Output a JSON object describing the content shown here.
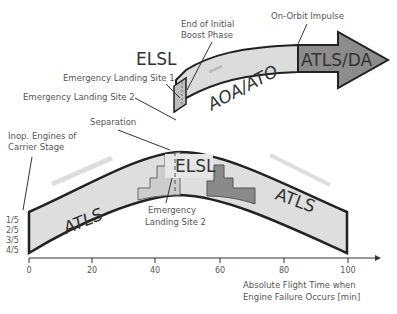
{
  "upper_arrow": {
    "segments": [
      {
        "label": "AOA/ATO",
        "color": "#d9d9d9"
      },
      {
        "label": "ATLS/DA",
        "color": "#8c8c8c"
      }
    ],
    "annotations": {
      "elsl": "ELSL",
      "site1": "Emergency Landing Site 1",
      "site2": "Emergency Landing Site 2",
      "end_boost_1": "End of Initial",
      "end_boost_2": "Boost Phase",
      "on_orbit": "On-Orbit Impulse"
    }
  },
  "lower_band": {
    "labels": {
      "left_atls": "ATLS",
      "right_atls": "ATLS",
      "elsl": "ELSL",
      "site2_line1": "Emergency",
      "site2_line2": "Landing Site 2",
      "separation": "Separation",
      "inop_line1": "Inop. Engines of",
      "inop_line2": "Carrier Stage"
    },
    "engine_levels": [
      "1/5",
      "2/5",
      "3/5",
      "4/5"
    ],
    "colors": {
      "band": "#dedede",
      "light_step": "#c8c8c8",
      "dark_step": "#8a8a8a",
      "outline": "#222222"
    }
  },
  "axis": {
    "ticks": [
      "0",
      "20",
      "40",
      "60",
      "80",
      "100"
    ],
    "label_line1": "Absolute Flight Time when",
    "label_line2": "Engine Failure Occurs [min]"
  }
}
